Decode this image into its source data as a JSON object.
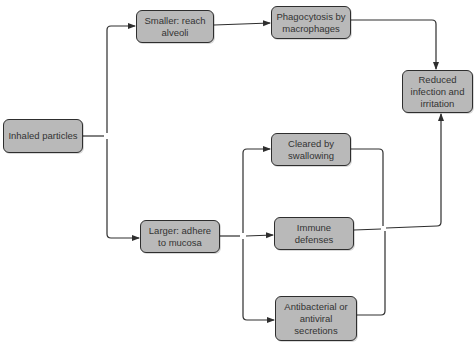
{
  "diagram": {
    "type": "flowchart",
    "colors": {
      "node_fill": "#b9b9b9",
      "node_border": "#2e2e2e",
      "text": "#333333",
      "edge": "#2e2e2e"
    },
    "nodes": {
      "inhaled": "Inhaled particles",
      "smaller": "Smaller: reach alveoli",
      "larger": "Larger: adhere to mucosa",
      "phagocytosis": "Phagocytosis by macrophages",
      "cleared": "Cleared by swallowing",
      "immune": "Immune defenses",
      "antibacterial": "Antibacterial or antiviral secretions",
      "reduced": "Reduced infection and irritation"
    },
    "edges": [
      [
        "inhaled",
        "smaller"
      ],
      [
        "inhaled",
        "larger"
      ],
      [
        "smaller",
        "phagocytosis"
      ],
      [
        "phagocytosis",
        "reduced"
      ],
      [
        "larger",
        "cleared"
      ],
      [
        "larger",
        "immune"
      ],
      [
        "larger",
        "antibacterial"
      ],
      [
        "cleared",
        "reduced"
      ],
      [
        "immune",
        "reduced"
      ],
      [
        "antibacterial",
        "reduced"
      ]
    ]
  }
}
